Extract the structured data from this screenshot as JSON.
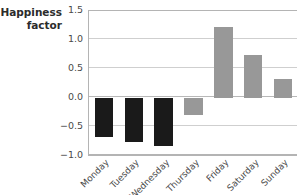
{
  "chart_data": {
    "type": "bar",
    "title": "",
    "subtitle": "",
    "xlabel": "",
    "ylabel": "Happiness\nfactor",
    "categories": [
      "Monday",
      "Tuesday",
      "Wednesday",
      "Thursday",
      "Friday",
      "Saturday",
      "Sunday"
    ],
    "values": [
      -0.68,
      -0.75,
      -0.83,
      -0.3,
      1.22,
      0.75,
      0.32
    ],
    "bar_colors": [
      "#1a1a1a",
      "#1a1a1a",
      "#1a1a1a",
      "#989898",
      "#989898",
      "#989898",
      "#989898"
    ],
    "ylim": [
      -1.0,
      1.5
    ],
    "yticks": [
      1.5,
      1.0,
      0.5,
      0.0,
      -0.5,
      -1.0
    ],
    "ytick_labels": [
      "1.5",
      "1.0",
      "0.5",
      "0.0",
      "−0.5",
      "−1.0"
    ],
    "grid": true,
    "grid_axis": "y",
    "legend": false,
    "legend_position": "none",
    "annotations": [],
    "colors": {
      "negative_bar": "#1a1a1a",
      "positive_bar": "#989898",
      "gridline": "#cfcfcf",
      "axis": "#b4b4b4",
      "text": "#4a4a4a",
      "title": "#2b2b2b",
      "background": "#ffffff"
    }
  }
}
